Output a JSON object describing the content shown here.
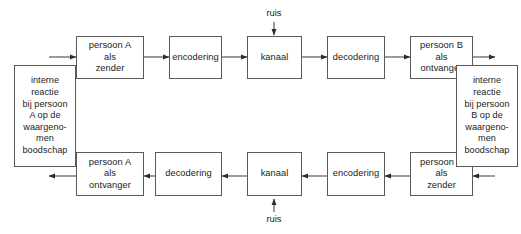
{
  "diagram": {
    "background_color": "#ffffff",
    "line_color": "#5a5a5a",
    "text_color": "#1b1b1b",
    "top_row": {
      "direction": "left-to-right",
      "nodes": [
        {
          "id": "persoon-a-zender",
          "label": "persoon A\nals\nzender"
        },
        {
          "id": "encodering-top",
          "label": "encodering"
        },
        {
          "id": "kanaal-top",
          "label": "kanaal"
        },
        {
          "id": "decodering-top",
          "label": "decodering"
        },
        {
          "id": "persoon-b-ontvanger",
          "label": "persoon B\nals\nontvanger"
        }
      ]
    },
    "bottom_row": {
      "direction": "right-to-left",
      "nodes": [
        {
          "id": "persoon-a-ontvanger",
          "label": "persoon A\nals\nontvanger"
        },
        {
          "id": "decodering-bottom",
          "label": "decodering"
        },
        {
          "id": "kanaal-bottom",
          "label": "kanaal"
        },
        {
          "id": "encodering-bottom",
          "label": "encodering"
        },
        {
          "id": "persoon-b-zender",
          "label": "persoon B\nals\nzender"
        }
      ]
    },
    "side_nodes": [
      {
        "id": "interne-reactie-a",
        "label": "interne\nreactie\nbij persoon\nA op de\nwaargeno-\nmen\nboodschap"
      },
      {
        "id": "interne-reactie-b",
        "label": "interne\nreactie\nbij persoon\nB op de\nwaargeno-\nmen\nboodschap"
      }
    ],
    "noise": [
      {
        "id": "ruis-top",
        "label": "ruis",
        "direction": "down",
        "target": "kanaal-top"
      },
      {
        "id": "ruis-bottom",
        "label": "ruis",
        "direction": "up",
        "target": "kanaal-bottom"
      }
    ]
  }
}
